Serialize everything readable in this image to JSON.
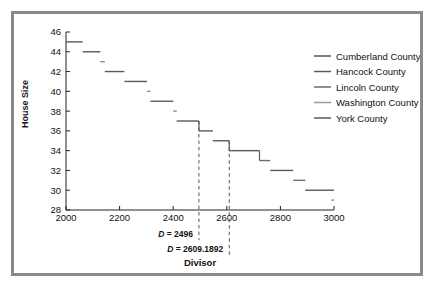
{
  "figure": {
    "border_color": "#8a8a8a",
    "background": "#ffffff"
  },
  "chart_data": {
    "type": "line",
    "subtype": "step",
    "title": "",
    "xlabel": "Divisor",
    "ylabel": "House Size",
    "xlim": [
      2000,
      3000
    ],
    "ylim": [
      28,
      46
    ],
    "xticks": [
      2000,
      2200,
      2400,
      2600,
      2800,
      3000
    ],
    "xtick_labels": [
      "2000",
      "2200",
      "2400",
      "2600",
      "2800",
      "3000"
    ],
    "yticks": [
      28,
      30,
      32,
      34,
      36,
      38,
      40,
      42,
      44,
      46
    ],
    "ytick_labels": [
      "28",
      "30",
      "32",
      "34",
      "36",
      "38",
      "40",
      "42",
      "44",
      "46"
    ],
    "grid": false,
    "legend_position": "right",
    "legend": [
      {
        "name": "Cumberland County",
        "color": "#555555"
      },
      {
        "name": "Hancock County",
        "color": "#5a5a5a"
      },
      {
        "name": "Lincoln County",
        "color": "#6b6b6b"
      },
      {
        "name": "Washington County",
        "color": "#9a9a9a"
      },
      {
        "name": "York County",
        "color": "#5a5a5a"
      }
    ],
    "steps": [
      {
        "x0": 2000,
        "x1": 2062,
        "y": 45,
        "color": "#5a5a5a"
      },
      {
        "x0": 2062,
        "x1": 2128,
        "y": 44,
        "color": "#5a5a5a"
      },
      {
        "x0": 2128,
        "x1": 2145,
        "y": 43,
        "color": "#8d8d8d"
      },
      {
        "x0": 2145,
        "x1": 2218,
        "y": 42,
        "color": "#5a5a5a"
      },
      {
        "x0": 2218,
        "x1": 2302,
        "y": 41,
        "color": "#5a5a5a"
      },
      {
        "x0": 2302,
        "x1": 2315,
        "y": 40,
        "color": "#8d8d8d"
      },
      {
        "x0": 2315,
        "x1": 2400,
        "y": 39,
        "color": "#5a5a5a"
      },
      {
        "x0": 2400,
        "x1": 2413,
        "y": 38,
        "color": "#8d8d8d"
      },
      {
        "x0": 2413,
        "x1": 2496,
        "y": 37,
        "color": "#5a5a5a"
      },
      {
        "x0": 2496,
        "x1": 2548,
        "y": 36,
        "color": "#5a5a5a"
      },
      {
        "x0": 2548,
        "x1": 2609,
        "y": 35,
        "color": "#5a5a5a"
      },
      {
        "x0": 2609,
        "x1": 2722,
        "y": 34,
        "color": "#5a5a5a"
      },
      {
        "x0": 2722,
        "x1": 2762,
        "y": 33,
        "color": "#6e6e6e"
      },
      {
        "x0": 2762,
        "x1": 2848,
        "y": 32,
        "color": "#5a5a5a"
      },
      {
        "x0": 2848,
        "x1": 2893,
        "y": 31,
        "color": "#6e6e6e"
      },
      {
        "x0": 2893,
        "x1": 3000,
        "y": 30,
        "color": "#5a5a5a"
      },
      {
        "x0": 2990,
        "x1": 3000,
        "y": 29,
        "color": "#8d8d8d"
      }
    ],
    "connectors": [
      {
        "x": 2496,
        "y0": 37,
        "y1": 36
      },
      {
        "x": 2609,
        "y0": 35,
        "y1": 34
      },
      {
        "x": 2722,
        "y0": 34,
        "y1": 33
      }
    ],
    "vlines": [
      {
        "x": 2496,
        "label": "D = 2496",
        "style": "dashed",
        "color": "#555555"
      },
      {
        "x": 2609.1892,
        "label": "D = 2609.1892",
        "style": "dashed",
        "color": "#555555"
      }
    ],
    "annotations": [
      {
        "id": "divisor-1",
        "text_prefix": "D",
        "text_rest": " = 2496"
      },
      {
        "id": "divisor-2",
        "text_prefix": "D",
        "text_rest": " = 2609.1892"
      }
    ]
  }
}
